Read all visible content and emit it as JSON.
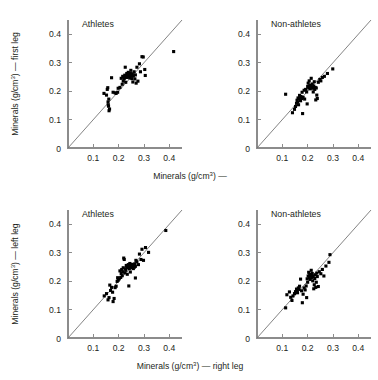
{
  "figure": {
    "title": "",
    "background": "#ffffff",
    "point_color": "#000000",
    "axis_color": "#8c8c8c",
    "reference_line_color": "#6e6e6e"
  },
  "axis": {
    "ticks": [
      "0",
      "0.1",
      "0.2",
      "0.3",
      "0.4"
    ],
    "tick_values": [
      0,
      0.1,
      0.2,
      0.3,
      0.4
    ],
    "xlim": [
      0,
      0.45
    ],
    "ylim": [
      0,
      0.45
    ],
    "origin_label": "0",
    "unit_base": "Minerals (g/cm",
    "unit_sup": "3",
    "unit_close": ")"
  },
  "labels": {
    "top_xlabel": "Minerals (g/cm³) —",
    "bottom_xlabel": "Minerals (g/cm³) — right leg",
    "top_ylabel": "Minerals (g/cm³) — first leg",
    "bottom_ylabel": "Minerals (g/cm³) — left leg",
    "top_xlabel_base": "Minerals (g/cm",
    "top_xlabel_tail": ") —",
    "bottom_xlabel_tail": ") — right leg",
    "top_ylabel_tail": ") — first leg",
    "bottom_ylabel_tail": ") — left leg"
  },
  "chart_data": {
    "type": "scatter",
    "title": "",
    "grid": false,
    "legend": "none",
    "axis_ticks": [
      0,
      0.1,
      0.2,
      0.3,
      0.4
    ],
    "xlim": [
      0,
      0.45
    ],
    "ylim": [
      0,
      0.45
    ],
    "reference_line": "y = x (identity line)",
    "panels": [
      {
        "id": "top-left",
        "title": "Athletes",
        "row": 0,
        "col": 0,
        "xlabel": "Minerals (g/cm³) —",
        "ylabel": "Minerals (g/cm³) — first leg",
        "points": [
          [
            0.142,
            0.192
          ],
          [
            0.152,
            0.186
          ],
          [
            0.155,
            0.206
          ],
          [
            0.157,
            0.212
          ],
          [
            0.158,
            0.162
          ],
          [
            0.159,
            0.152
          ],
          [
            0.16,
            0.147
          ],
          [
            0.161,
            0.172
          ],
          [
            0.162,
            0.131
          ],
          [
            0.164,
            0.137
          ],
          [
            0.172,
            0.247
          ],
          [
            0.178,
            0.196
          ],
          [
            0.186,
            0.194
          ],
          [
            0.19,
            0.192
          ],
          [
            0.196,
            0.196
          ],
          [
            0.198,
            0.21
          ],
          [
            0.205,
            0.213
          ],
          [
            0.21,
            0.245
          ],
          [
            0.214,
            0.224
          ],
          [
            0.216,
            0.252
          ],
          [
            0.218,
            0.235
          ],
          [
            0.22,
            0.249
          ],
          [
            0.222,
            0.243
          ],
          [
            0.224,
            0.256
          ],
          [
            0.226,
            0.284
          ],
          [
            0.228,
            0.231
          ],
          [
            0.229,
            0.252
          ],
          [
            0.231,
            0.248
          ],
          [
            0.232,
            0.262
          ],
          [
            0.234,
            0.257
          ],
          [
            0.236,
            0.254
          ],
          [
            0.238,
            0.266
          ],
          [
            0.24,
            0.249
          ],
          [
            0.242,
            0.258
          ],
          [
            0.244,
            0.246
          ],
          [
            0.246,
            0.262
          ],
          [
            0.248,
            0.273
          ],
          [
            0.25,
            0.255
          ],
          [
            0.252,
            0.244
          ],
          [
            0.254,
            0.261
          ],
          [
            0.256,
            0.232
          ],
          [
            0.258,
            0.253
          ],
          [
            0.261,
            0.268
          ],
          [
            0.264,
            0.243
          ],
          [
            0.266,
            0.257
          ],
          [
            0.269,
            0.228
          ],
          [
            0.272,
            0.284
          ],
          [
            0.276,
            0.235
          ],
          [
            0.282,
            0.296
          ],
          [
            0.286,
            0.268
          ],
          [
            0.292,
            0.321
          ],
          [
            0.297,
            0.32
          ],
          [
            0.303,
            0.276
          ],
          [
            0.305,
            0.255
          ],
          [
            0.417,
            0.339
          ]
        ]
      },
      {
        "id": "top-right",
        "title": "Non-athletes",
        "row": 0,
        "col": 1,
        "xlabel": "Minerals (g/cm³) —",
        "ylabel": "",
        "points": [
          [
            0.113,
            0.189
          ],
          [
            0.14,
            0.124
          ],
          [
            0.148,
            0.136
          ],
          [
            0.152,
            0.146
          ],
          [
            0.156,
            0.157
          ],
          [
            0.158,
            0.168
          ],
          [
            0.16,
            0.161
          ],
          [
            0.162,
            0.176
          ],
          [
            0.164,
            0.152
          ],
          [
            0.166,
            0.172
          ],
          [
            0.168,
            0.185
          ],
          [
            0.17,
            0.176
          ],
          [
            0.172,
            0.166
          ],
          [
            0.174,
            0.181
          ],
          [
            0.176,
            0.174
          ],
          [
            0.178,
            0.196
          ],
          [
            0.18,
            0.121
          ],
          [
            0.182,
            0.178
          ],
          [
            0.186,
            0.203
          ],
          [
            0.188,
            0.172
          ],
          [
            0.192,
            0.206
          ],
          [
            0.196,
            0.197
          ],
          [
            0.198,
            0.155
          ],
          [
            0.2,
            0.216
          ],
          [
            0.202,
            0.228
          ],
          [
            0.204,
            0.211
          ],
          [
            0.206,
            0.236
          ],
          [
            0.208,
            0.219
          ],
          [
            0.21,
            0.208
          ],
          [
            0.212,
            0.221
          ],
          [
            0.214,
            0.245
          ],
          [
            0.216,
            0.214
          ],
          [
            0.218,
            0.225
          ],
          [
            0.22,
            0.21
          ],
          [
            0.222,
            0.197
          ],
          [
            0.224,
            0.218
          ],
          [
            0.226,
            0.233
          ],
          [
            0.228,
            0.206
          ],
          [
            0.23,
            0.213
          ],
          [
            0.232,
            0.169
          ],
          [
            0.234,
            0.211
          ],
          [
            0.236,
            0.186
          ],
          [
            0.238,
            0.174
          ],
          [
            0.242,
            0.231
          ],
          [
            0.248,
            0.241
          ],
          [
            0.252,
            0.236
          ],
          [
            0.258,
            0.248
          ],
          [
            0.266,
            0.252
          ],
          [
            0.278,
            0.262
          ],
          [
            0.299,
            0.278
          ]
        ]
      },
      {
        "id": "bottom-left",
        "title": "Athletes",
        "row": 1,
        "col": 0,
        "xlabel": "Minerals (g/cm³) — right leg",
        "ylabel": "Minerals (g/cm³) — left leg",
        "points": [
          [
            0.143,
            0.148
          ],
          [
            0.152,
            0.156
          ],
          [
            0.158,
            0.134
          ],
          [
            0.162,
            0.142
          ],
          [
            0.165,
            0.186
          ],
          [
            0.168,
            0.167
          ],
          [
            0.172,
            0.178
          ],
          [
            0.176,
            0.161
          ],
          [
            0.178,
            0.128
          ],
          [
            0.182,
            0.139
          ],
          [
            0.186,
            0.177
          ],
          [
            0.19,
            0.182
          ],
          [
            0.194,
            0.199
          ],
          [
            0.196,
            0.212
          ],
          [
            0.198,
            0.203
          ],
          [
            0.202,
            0.208
          ],
          [
            0.205,
            0.236
          ],
          [
            0.208,
            0.213
          ],
          [
            0.21,
            0.227
          ],
          [
            0.212,
            0.241
          ],
          [
            0.214,
            0.219
          ],
          [
            0.216,
            0.233
          ],
          [
            0.218,
            0.247
          ],
          [
            0.22,
            0.281
          ],
          [
            0.222,
            0.276
          ],
          [
            0.224,
            0.229
          ],
          [
            0.226,
            0.243
          ],
          [
            0.228,
            0.238
          ],
          [
            0.23,
            0.255
          ],
          [
            0.232,
            0.249
          ],
          [
            0.234,
            0.224
          ],
          [
            0.236,
            0.247
          ],
          [
            0.238,
            0.258
          ],
          [
            0.24,
            0.251
          ],
          [
            0.242,
            0.244
          ],
          [
            0.244,
            0.262
          ],
          [
            0.246,
            0.232
          ],
          [
            0.248,
            0.252
          ],
          [
            0.25,
            0.257
          ],
          [
            0.252,
            0.247
          ],
          [
            0.254,
            0.259
          ],
          [
            0.256,
            0.253
          ],
          [
            0.258,
            0.244
          ],
          [
            0.26,
            0.256
          ],
          [
            0.262,
            0.249
          ],
          [
            0.264,
            0.261
          ],
          [
            0.266,
            0.252
          ],
          [
            0.268,
            0.273
          ],
          [
            0.24,
            0.183
          ],
          [
            0.266,
            0.211
          ],
          [
            0.272,
            0.268
          ],
          [
            0.278,
            0.258
          ],
          [
            0.282,
            0.295
          ],
          [
            0.288,
            0.276
          ],
          [
            0.292,
            0.312
          ],
          [
            0.298,
            0.273
          ],
          [
            0.306,
            0.318
          ],
          [
            0.318,
            0.301
          ],
          [
            0.386,
            0.378
          ]
        ]
      },
      {
        "id": "bottom-right",
        "title": "Non-athletes",
        "row": 1,
        "col": 1,
        "xlabel": "Minerals (g/cm³) — right leg",
        "ylabel": "",
        "points": [
          [
            0.113,
            0.106
          ],
          [
            0.118,
            0.152
          ],
          [
            0.128,
            0.162
          ],
          [
            0.133,
            0.143
          ],
          [
            0.138,
            0.132
          ],
          [
            0.142,
            0.148
          ],
          [
            0.148,
            0.156
          ],
          [
            0.152,
            0.163
          ],
          [
            0.156,
            0.172
          ],
          [
            0.158,
            0.166
          ],
          [
            0.16,
            0.159
          ],
          [
            0.163,
            0.176
          ],
          [
            0.166,
            0.171
          ],
          [
            0.168,
            0.182
          ],
          [
            0.172,
            0.207
          ],
          [
            0.176,
            0.166
          ],
          [
            0.179,
            0.124
          ],
          [
            0.182,
            0.154
          ],
          [
            0.186,
            0.176
          ],
          [
            0.19,
            0.169
          ],
          [
            0.194,
            0.183
          ],
          [
            0.196,
            0.142
          ],
          [
            0.198,
            0.208
          ],
          [
            0.2,
            0.196
          ],
          [
            0.202,
            0.218
          ],
          [
            0.204,
            0.231
          ],
          [
            0.206,
            0.212
          ],
          [
            0.208,
            0.224
          ],
          [
            0.21,
            0.206
          ],
          [
            0.212,
            0.219
          ],
          [
            0.214,
            0.238
          ],
          [
            0.216,
            0.213
          ],
          [
            0.218,
            0.227
          ],
          [
            0.22,
            0.201
          ],
          [
            0.222,
            0.216
          ],
          [
            0.224,
            0.173
          ],
          [
            0.226,
            0.187
          ],
          [
            0.228,
            0.209
          ],
          [
            0.23,
            0.222
          ],
          [
            0.232,
            0.178
          ],
          [
            0.234,
            0.196
          ],
          [
            0.236,
            0.228
          ],
          [
            0.238,
            0.216
          ],
          [
            0.242,
            0.181
          ],
          [
            0.246,
            0.233
          ],
          [
            0.252,
            0.226
          ],
          [
            0.258,
            0.241
          ],
          [
            0.264,
            0.218
          ],
          [
            0.272,
            0.253
          ],
          [
            0.284,
            0.266
          ],
          [
            0.288,
            0.293
          ]
        ]
      }
    ]
  }
}
